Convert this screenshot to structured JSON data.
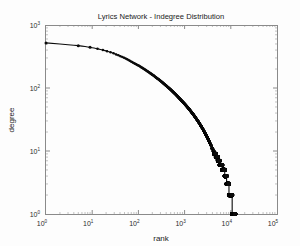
{
  "chart_data": {
    "type": "scatter",
    "title": "Lyrics Network - Indegree Distribution",
    "xlabel": "rank",
    "ylabel": "degree",
    "xscale": "log",
    "yscale": "log",
    "xlim": [
      1,
      100000
    ],
    "ylim": [
      1,
      1000
    ],
    "grid": false,
    "legend": null,
    "marker": "filled-circle",
    "marker_color": "#0b0b0b",
    "xticks": [
      1,
      10,
      100,
      1000,
      10000,
      100000
    ],
    "xtick_labels": [
      "10^0",
      "10^1",
      "10^2",
      "10^3",
      "10^4",
      "10^5"
    ],
    "yticks": [
      1,
      10,
      100,
      1000
    ],
    "ytick_labels": [
      "10^0",
      "10^1",
      "10^2",
      "10^3"
    ],
    "x": [
      1,
      2,
      3,
      4,
      5,
      6,
      7,
      8,
      9,
      10,
      13,
      16,
      20,
      25,
      32,
      40,
      50,
      63,
      80,
      100,
      126,
      158,
      200,
      251,
      316,
      398,
      501,
      631,
      794,
      1000,
      1259,
      1585,
      1995,
      2512,
      3162,
      3981,
      4500,
      5012,
      5500,
      6000,
      6310,
      6800,
      7200,
      7600,
      7943,
      8300,
      8700,
      9000,
      9300,
      9600,
      10000,
      10500,
      11000,
      12000,
      12500
    ],
    "y": [
      520,
      500,
      487,
      478,
      470,
      462,
      455,
      448,
      442,
      436,
      420,
      405,
      388,
      370,
      345,
      322,
      300,
      275,
      248,
      228,
      205,
      184,
      163,
      144,
      126,
      109,
      94,
      80,
      67,
      56,
      46,
      37,
      29,
      22,
      16,
      11,
      9,
      8,
      7,
      6,
      6,
      5,
      5,
      4,
      4,
      3,
      3,
      3,
      2,
      2,
      2,
      2,
      1,
      1,
      1
    ],
    "series": [
      {
        "name": "indegree",
        "n_points": 12500,
        "x_start": 1,
        "x_end": 12500,
        "y_start": 520,
        "y_end": 1
      }
    ]
  },
  "axes": {
    "x": {
      "label": "rank",
      "ticks": [
        {
          "value": 1,
          "mantissa": "10",
          "exponent": "0"
        },
        {
          "value": 10,
          "mantissa": "10",
          "exponent": "1"
        },
        {
          "value": 100,
          "mantissa": "10",
          "exponent": "2"
        },
        {
          "value": 1000,
          "mantissa": "10",
          "exponent": "3"
        },
        {
          "value": 10000,
          "mantissa": "10",
          "exponent": "4"
        },
        {
          "value": 100000,
          "mantissa": "10",
          "exponent": "5"
        }
      ]
    },
    "y": {
      "label": "degree",
      "ticks": [
        {
          "value": 1000,
          "mantissa": "10",
          "exponent": "3"
        },
        {
          "value": 100,
          "mantissa": "10",
          "exponent": "2"
        },
        {
          "value": 10,
          "mantissa": "10",
          "exponent": "1"
        },
        {
          "value": 1,
          "mantissa": "10",
          "exponent": "0"
        }
      ]
    }
  },
  "colors": {
    "data": "#0b0b0b",
    "frame": "#8a8a8a",
    "text": "#1a1a1a",
    "background": "#fdfdfd"
  }
}
